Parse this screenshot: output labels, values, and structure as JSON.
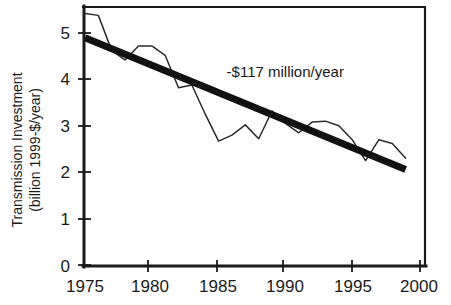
{
  "chart_data": {
    "type": "line",
    "title": "",
    "xlabel": "",
    "ylabel": "Transmission Investment (billion 1999-$/year)",
    "ylabel_line1": "Transmission Investment",
    "ylabel_line2": "(billion 1999-$/year)",
    "xlim": [
      1975,
      2000
    ],
    "ylim": [
      0,
      5.5
    ],
    "xticks": [
      "1975",
      "1980",
      "1985",
      "1990",
      "1995",
      "2000"
    ],
    "xtick_values": [
      1975,
      1980,
      1985,
      1990,
      1995,
      2000
    ],
    "yticks": [
      "0",
      "1",
      "2",
      "3",
      "4",
      "5"
    ],
    "ytick_values": [
      0,
      1,
      2,
      3,
      4,
      5
    ],
    "grid": false,
    "legend": "none",
    "annotations": [
      {
        "name": "slope-annotation",
        "text": "-$117 million/year",
        "x": 1985.6,
        "y": 4.05
      }
    ],
    "series": [
      {
        "name": "Transmission investment",
        "style": "thin-line",
        "x": [
          1975,
          1976,
          1977,
          1978,
          1979,
          1980,
          1981,
          1982,
          1983,
          1984,
          1985,
          1986,
          1987,
          1988,
          1989,
          1990,
          1991,
          1992,
          1993,
          1994,
          1995,
          1996,
          1997,
          1998,
          1999
        ],
        "values": [
          5.42,
          5.38,
          4.62,
          4.42,
          4.72,
          4.72,
          4.52,
          3.82,
          3.88,
          3.25,
          2.67,
          2.8,
          3.02,
          2.72,
          3.32,
          3.05,
          2.85,
          3.08,
          3.1,
          3.0,
          2.7,
          2.25,
          2.7,
          2.62,
          2.3
        ]
      },
      {
        "name": "Linear trend",
        "style": "thick-line",
        "x": [
          1975,
          1999
        ],
        "values": [
          4.9,
          2.06
        ],
        "slope_per_year": -0.117
      }
    ]
  },
  "colors": {
    "axis": "#1a1a1a",
    "data_line": "#2b2b2b",
    "trend_line": "#111111",
    "background": "#ffffff"
  }
}
